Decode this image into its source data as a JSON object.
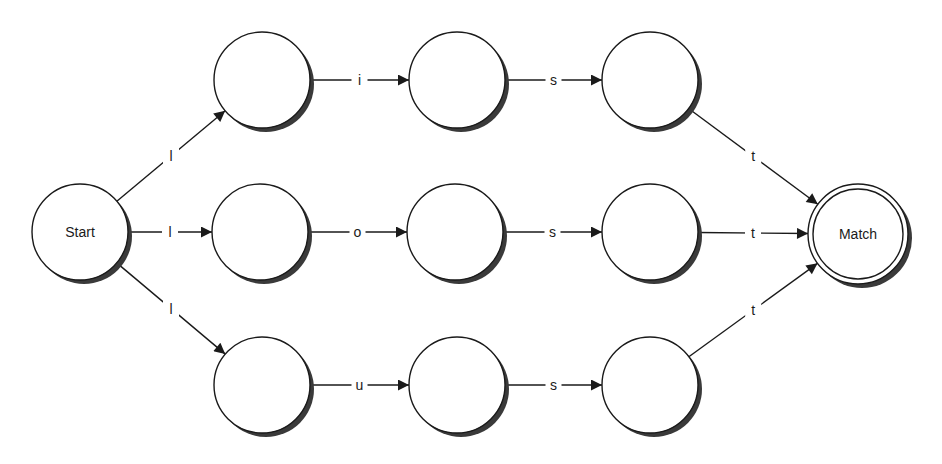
{
  "diagram": {
    "type": "finite-state-automaton",
    "nodes": [
      {
        "id": "start",
        "label": "Start",
        "x": 80,
        "y": 232,
        "accepting": false
      },
      {
        "id": "r1n1",
        "label": "",
        "x": 262,
        "y": 80,
        "accepting": false
      },
      {
        "id": "r1n2",
        "label": "",
        "x": 457,
        "y": 80,
        "accepting": false
      },
      {
        "id": "r1n3",
        "label": "",
        "x": 650,
        "y": 80,
        "accepting": false
      },
      {
        "id": "r2n1",
        "label": "",
        "x": 260,
        "y": 232,
        "accepting": false
      },
      {
        "id": "r2n2",
        "label": "",
        "x": 455,
        "y": 232,
        "accepting": false
      },
      {
        "id": "r2n3",
        "label": "",
        "x": 650,
        "y": 232,
        "accepting": false
      },
      {
        "id": "r3n1",
        "label": "",
        "x": 262,
        "y": 385,
        "accepting": false
      },
      {
        "id": "r3n2",
        "label": "",
        "x": 457,
        "y": 385,
        "accepting": false
      },
      {
        "id": "r3n3",
        "label": "",
        "x": 650,
        "y": 385,
        "accepting": false
      },
      {
        "id": "match",
        "label": "Match",
        "x": 858,
        "y": 234,
        "accepting": true
      }
    ],
    "edges": [
      {
        "from": "start",
        "to": "r1n1",
        "label": "l"
      },
      {
        "from": "start",
        "to": "r2n1",
        "label": "l"
      },
      {
        "from": "start",
        "to": "r3n1",
        "label": "l"
      },
      {
        "from": "r1n1",
        "to": "r1n2",
        "label": "i"
      },
      {
        "from": "r1n2",
        "to": "r1n3",
        "label": "s"
      },
      {
        "from": "r1n3",
        "to": "match",
        "label": "t"
      },
      {
        "from": "r2n1",
        "to": "r2n2",
        "label": "o"
      },
      {
        "from": "r2n2",
        "to": "r2n3",
        "label": "s"
      },
      {
        "from": "r2n3",
        "to": "match",
        "label": "t"
      },
      {
        "from": "r3n1",
        "to": "r3n2",
        "label": "u"
      },
      {
        "from": "r3n2",
        "to": "r3n3",
        "label": "s"
      },
      {
        "from": "r3n3",
        "to": "match",
        "label": "t"
      }
    ]
  }
}
